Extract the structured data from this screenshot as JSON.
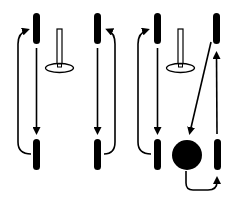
{
  "diagram": {
    "title": "Drill movement pattern diagram",
    "colors": {
      "ink": "#000000",
      "background": "#ffffff"
    },
    "panels": [
      {
        "id": "panel-1",
        "description": "Two players with cone; top player passes/moves down, bottom player loops back up on the left"
      },
      {
        "id": "panel-2",
        "description": "Two players; top player moves down, bottom player loops back up on the right"
      },
      {
        "id": "panel-3",
        "description": "Players with cone and ball; diagonal pass to ball, ball carried to right bottom player, who moves up"
      }
    ],
    "elements": {
      "players": 8,
      "cones": 2,
      "balls": 1
    }
  }
}
